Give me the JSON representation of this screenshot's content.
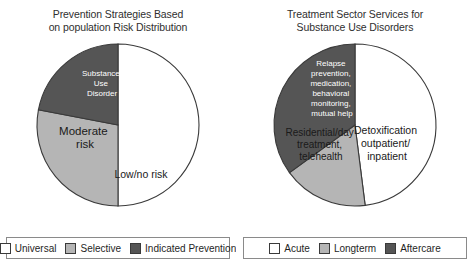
{
  "figure": {
    "background_color": "#ffffff",
    "panel_count": 2
  },
  "palette": {
    "white_slice": "#ffffff",
    "light_gray_slice": "#b5b5b5",
    "dark_gray_slice": "#555555",
    "outline": "#3a3a3a",
    "text_dark": "#1a1a1a",
    "text_light": "#ffffff",
    "legend_border": "#8a8a8a"
  },
  "panels": [
    {
      "id": "prevention",
      "title_line1": "Prevention Strategies Based",
      "title_line2": "on population Risk Distribution",
      "legend": [
        {
          "label": "Universal",
          "color": "#ffffff"
        },
        {
          "label": "Selective",
          "color": "#b5b5b5"
        },
        {
          "label": "Indicated Prevention",
          "color": "#555555"
        }
      ],
      "slice_labels": [
        {
          "text": "Low/no risk",
          "lines": [
            "Low/no risk"
          ]
        },
        {
          "text": "Moderate risk",
          "lines": [
            "Moderate",
            "risk"
          ]
        },
        {
          "text": "Substance Use Disorder",
          "lines": [
            "Substance",
            "Use",
            "Disorder"
          ]
        }
      ]
    },
    {
      "id": "treatment",
      "title_line1": "Treatment Sector Services for",
      "title_line2": "Substance Use Disorders",
      "legend": [
        {
          "label": "Acute",
          "color": "#ffffff"
        },
        {
          "label": "Longterm",
          "color": "#b5b5b5"
        },
        {
          "label": "Aftercare",
          "color": "#555555"
        }
      ],
      "slice_labels": [
        {
          "text": "Detoxification outpatient/ inpatient",
          "lines": [
            "Detoxification",
            "outpatient/",
            "inpatient"
          ]
        },
        {
          "text": "Residential/day treatment, telehealth",
          "lines": [
            "Residential/day",
            "treatment,",
            "telehealth"
          ]
        },
        {
          "text": "Relapse prevention, medication, behavioral monitoring, mutual help",
          "lines": [
            "Relapse",
            "prevention,",
            "medication,",
            "behavioral",
            "monitoring,",
            "mutual help"
          ]
        }
      ]
    }
  ],
  "chart_data": [
    {
      "type": "pie",
      "title": "Prevention Strategies Based on population Risk Distribution",
      "categories": [
        "Low/no risk",
        "Moderate risk",
        "Substance Use Disorder"
      ],
      "values": [
        50,
        28,
        22
      ],
      "units": "percent",
      "colors": [
        "#ffffff",
        "#b5b5b5",
        "#555555"
      ],
      "legend_entries": [
        "Universal",
        "Selective",
        "Indicated Prevention"
      ],
      "legend_position": "bottom",
      "start_angle_deg": 0,
      "direction": "clockwise",
      "grid": false,
      "xlabel": "",
      "ylabel": ""
    },
    {
      "type": "pie",
      "title": "Treatment Sector Services for Substance Use Disorders",
      "categories": [
        "Detoxification outpatient/inpatient",
        "Residential/day treatment, telehealth",
        "Relapse prevention, medication, behavioral monitoring, mutual help"
      ],
      "values": [
        48,
        17,
        35
      ],
      "units": "percent",
      "colors": [
        "#ffffff",
        "#b5b5b5",
        "#555555"
      ],
      "legend_entries": [
        "Acute",
        "Longterm",
        "Aftercare"
      ],
      "legend_position": "bottom",
      "start_angle_deg": 0,
      "direction": "clockwise",
      "grid": false,
      "xlabel": "",
      "ylabel": ""
    }
  ]
}
